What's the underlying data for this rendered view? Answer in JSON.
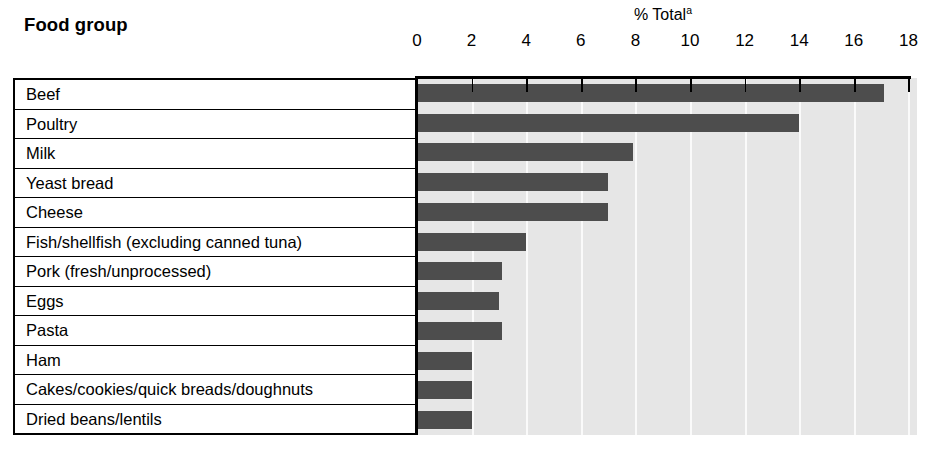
{
  "header": {
    "row_header_label": "Food group",
    "axis_title": "% Total",
    "axis_title_superscript": "a"
  },
  "axis": {
    "tick_labels": [
      "0",
      "2",
      "4",
      "6",
      "8",
      "10",
      "12",
      "14",
      "16",
      "18"
    ],
    "min": 0,
    "max": 18,
    "step": 2
  },
  "colors": {
    "bar": "#4d4d4d",
    "plot_background": "#e6e6e6",
    "gridline": "#fafafa",
    "axis": "#000000",
    "page_background": "#ffffff"
  },
  "chart_data": {
    "type": "bar",
    "orientation": "horizontal",
    "title": "",
    "xlabel": "% Total",
    "ylabel": "Food group",
    "xlim": [
      0,
      18
    ],
    "grid": true,
    "legend": "none",
    "categories": [
      "Beef",
      "Poultry",
      "Milk",
      "Yeast bread",
      "Cheese",
      "Fish/shellfish (excluding canned tuna)",
      "Pork (fresh/unprocessed)",
      "Eggs",
      "Pasta",
      "Ham",
      "Cakes/cookies/quick breads/doughnuts",
      "Dried beans/lentils"
    ],
    "values": [
      17.1,
      14.0,
      7.9,
      7.0,
      7.0,
      4.0,
      3.1,
      3.0,
      3.1,
      2.0,
      2.0,
      2.0
    ]
  }
}
